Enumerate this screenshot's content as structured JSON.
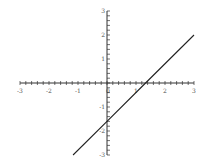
{
  "chart_data": {
    "type": "line",
    "title": "",
    "xlabel": "",
    "ylabel": "",
    "xlim": [
      -3,
      3
    ],
    "ylim": [
      -3,
      3
    ],
    "grid": false,
    "legend": null,
    "axes_style": "centered-at-origin",
    "x_ticks": [
      -3,
      -2,
      -1,
      0,
      1,
      2,
      3
    ],
    "y_ticks": [
      -3,
      -2,
      -1,
      0,
      1,
      2,
      3
    ],
    "x_tick_labels": [
      "-3",
      "-2",
      "-1",
      "0",
      "1",
      "2",
      "3"
    ],
    "y_tick_labels": [
      "-3",
      "-2",
      "-1",
      "0",
      "1",
      "2",
      "3"
    ],
    "minor_tick_step": 0.2,
    "series": [
      {
        "name": "y = 1.2x - 1.6",
        "color": "#222222",
        "x": [
          -1.17,
          0,
          1.33,
          3
        ],
        "y": [
          -3,
          -1.6,
          0,
          2
        ]
      }
    ]
  },
  "colors": {
    "axis": "#333333",
    "line": "#222222",
    "label": "#555555",
    "background": "#ffffff"
  }
}
